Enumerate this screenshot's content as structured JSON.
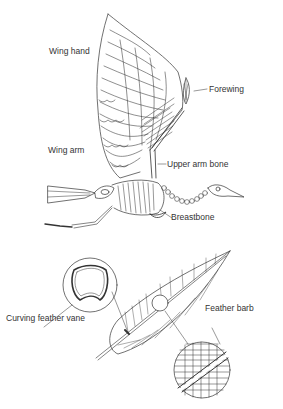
{
  "diagram": {
    "top": {
      "subject": "bird skeleton with raised wing",
      "labels": {
        "wing_hand": "Wing hand",
        "forewing": "Forewing",
        "wing_arm": "Wing arm",
        "upper_arm_bone": "Upper arm bone",
        "breastbone": "Breastbone"
      }
    },
    "bottom": {
      "subject": "feather with cross-section and barb detail",
      "labels": {
        "curving_feather_vane": "Curving feather vane",
        "feather_barb": "Feather barb"
      }
    },
    "colors": {
      "line": "#333333",
      "background": "#ffffff"
    }
  }
}
